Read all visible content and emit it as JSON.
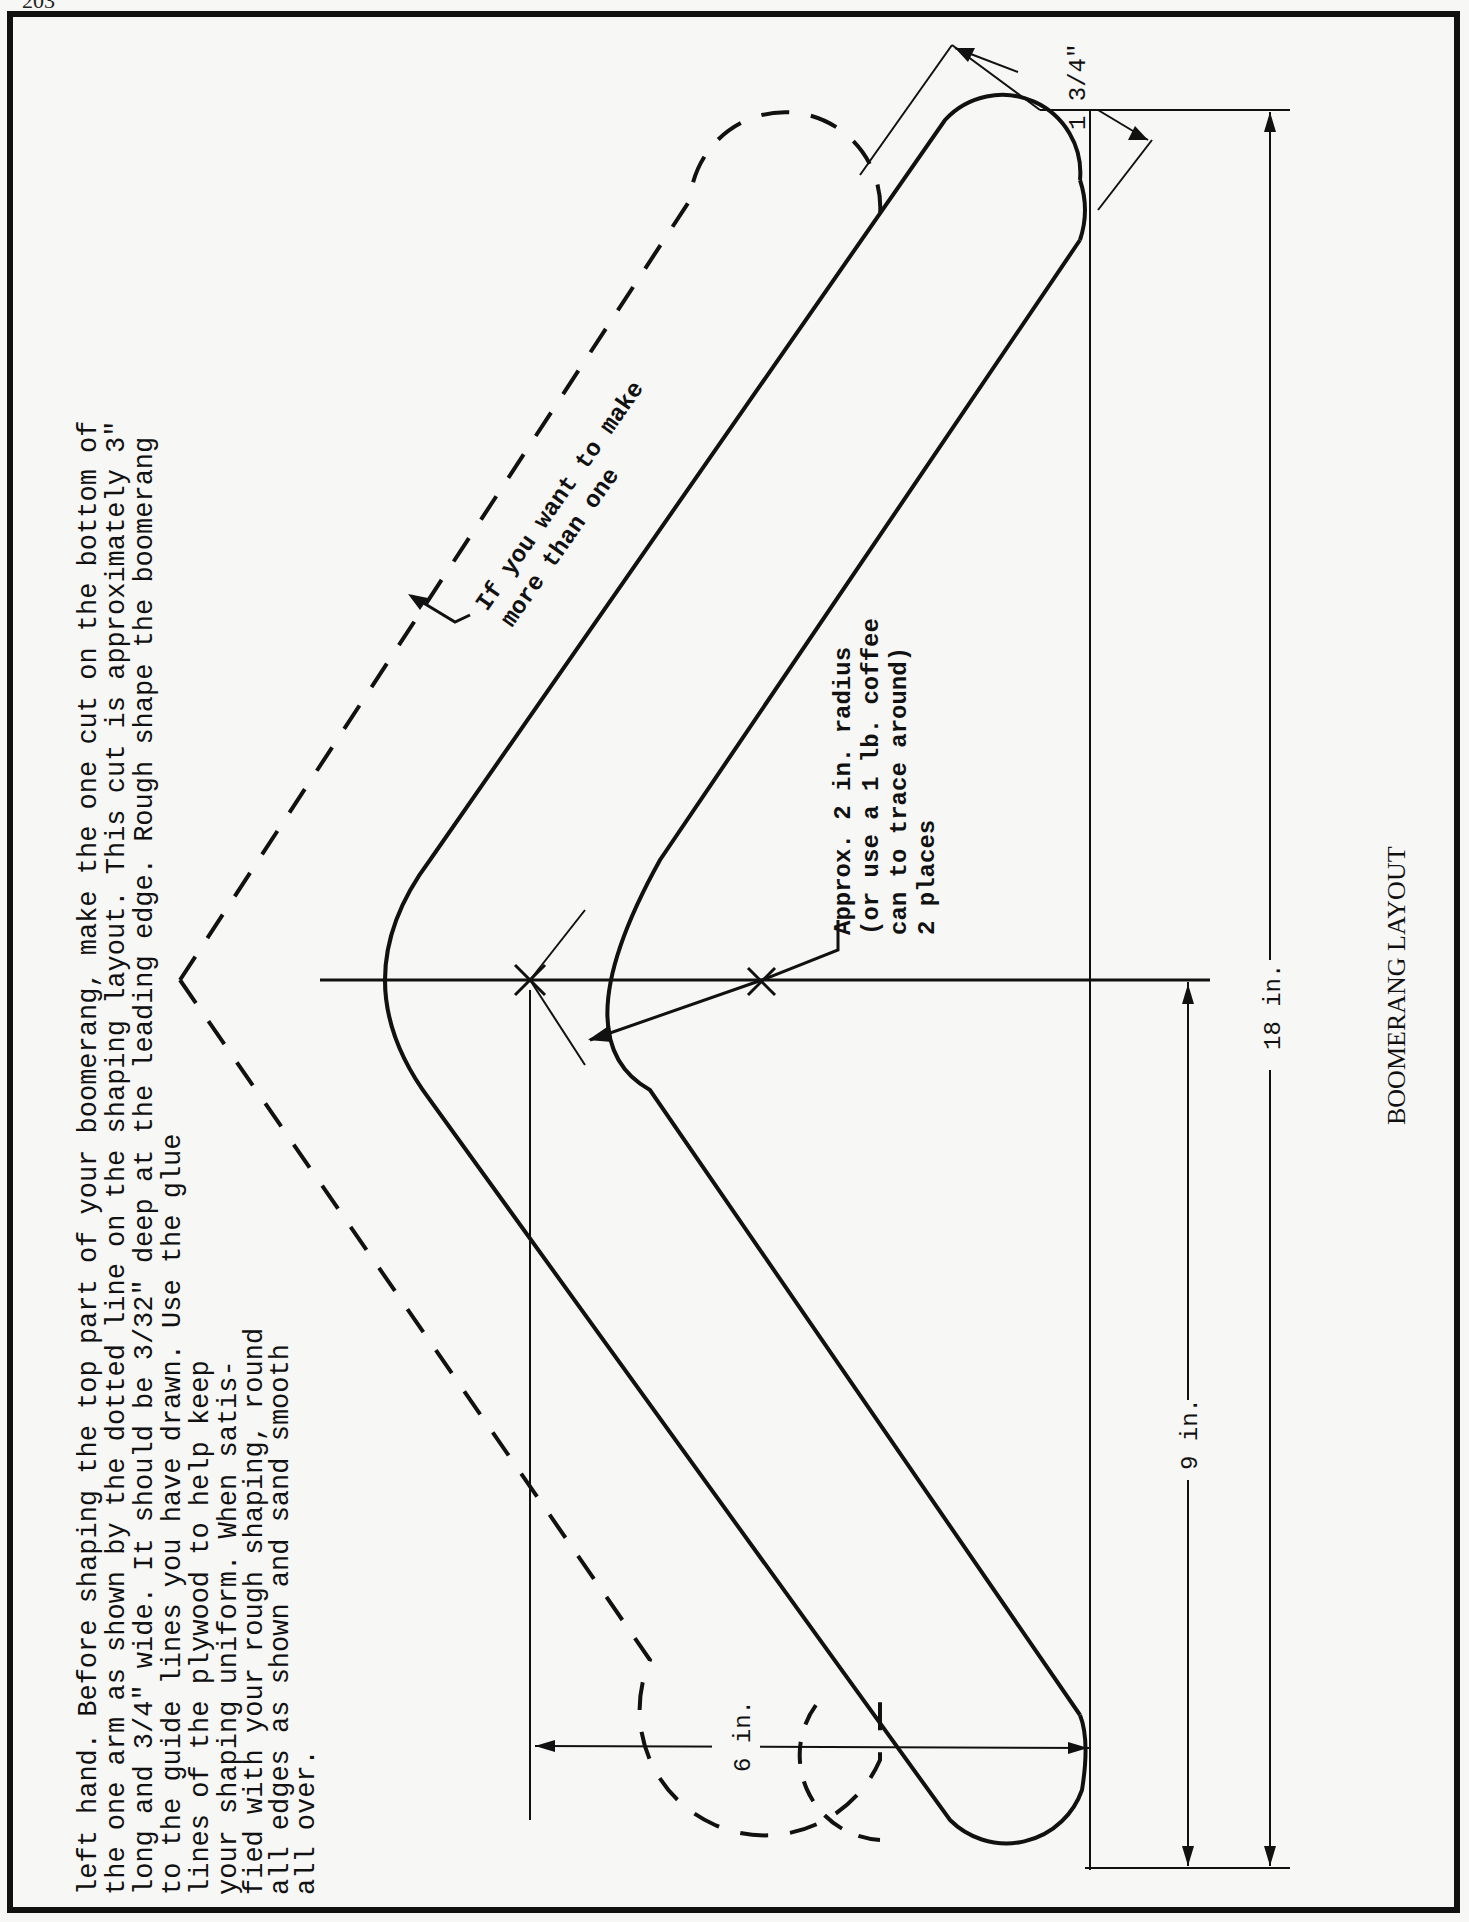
{
  "page": {
    "page_number_partial": "203",
    "orientation": "rotated-90-ccw"
  },
  "instructions": {
    "lines": [
      "left hand. Before shaping the top part of your boomerang, make the one cut on the bottom of",
      "the one arm as shown by the dotted line on the shaping layout. This cut is approximately 3\"",
      "long and 3/4\" wide. It should be 3/32\" deep at the leading edge. Rough shape the boomerang",
      "to the guide lines you have drawn. Use the glue",
      "lines of the plywood to help keep",
      "your shaping uniform. When satis-",
      "fied with your rough shaping, round",
      "all edges as shown and sand smooth",
      "all over."
    ]
  },
  "diagram": {
    "title": "BOOMERANG LAYOUT",
    "annotations": {
      "more_than_one": [
        "If you want to make",
        "more than one"
      ],
      "radius_note": [
        "Approx. 2 in. radius",
        "(or use a 1 lb. coffee",
        "can to trace around)",
        "2 places"
      ]
    },
    "dimensions": {
      "width": "1 3/4\"",
      "total_length": "18 in.",
      "half_length": "9 in.",
      "depth": "6 in."
    },
    "colors": {
      "ink": "#111111",
      "paper": "#f7f7f5"
    }
  }
}
